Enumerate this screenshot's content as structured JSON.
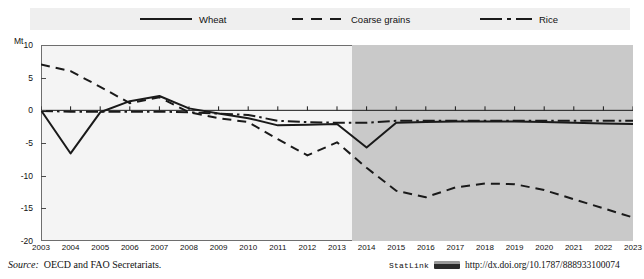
{
  "legend": {
    "entries": [
      {
        "label": "Wheat",
        "style": "solid",
        "key": "wheat-legend-key"
      },
      {
        "label": "Coarse grains",
        "style": "dashed",
        "key": "coarse-grains-legend-key"
      },
      {
        "label": "Rice",
        "style": "dash-dot",
        "key": "rice-legend-key"
      }
    ]
  },
  "axis": {
    "unit": "Mt",
    "y_ticks": [
      "10",
      "5",
      "0",
      "-5",
      "-10",
      "-15",
      "-20"
    ],
    "x_ticks": [
      "2003",
      "2004",
      "2005",
      "2006",
      "2007",
      "2008",
      "2009",
      "2010",
      "2011",
      "2012",
      "2013",
      "2014",
      "2015",
      "2016",
      "2017",
      "2018",
      "2019",
      "2020",
      "2021",
      "2022",
      "2023"
    ]
  },
  "footer": {
    "source_label": "Source:",
    "source_text": "OECD and FAO Secretariats.",
    "statlink_label": "StatLink",
    "statlink_url": "http://dx.doi.org/10.1787/888933100074"
  },
  "colors": {
    "line": "#1a1a1a",
    "plot_background": "#f4f4f4",
    "projection_shade": "#c9c9c9",
    "legend_band": "#efefef",
    "axis": "#6e6e6e"
  },
  "chart_data": {
    "type": "line",
    "title": "",
    "xlabel": "",
    "ylabel": "Mt",
    "ylim": [
      -20,
      10
    ],
    "xlim": [
      2003,
      2023
    ],
    "grid": false,
    "legend_position": "top",
    "projection_start": 2013.5,
    "annotations": [
      {
        "text": "Shaded area from 2014 onward denotes the projection period"
      }
    ],
    "x": [
      2003,
      2004,
      2005,
      2006,
      2007,
      2008,
      2009,
      2010,
      2011,
      2012,
      2013,
      2014,
      2015,
      2016,
      2017,
      2018,
      2019,
      2020,
      2021,
      2022,
      2023
    ],
    "series": [
      {
        "name": "Wheat",
        "style": "solid",
        "values": [
          0.0,
          -6.6,
          -0.3,
          1.4,
          2.2,
          0.3,
          -0.5,
          -1.2,
          -2.3,
          -2.2,
          -2.1,
          -5.7,
          -1.9,
          -1.8,
          -1.7,
          -1.7,
          -1.7,
          -1.8,
          -1.9,
          -2.0,
          -2.1
        ]
      },
      {
        "name": "Coarse grains",
        "style": "dashed",
        "values": [
          7.0,
          6.0,
          3.6,
          1.1,
          2.0,
          -0.3,
          -1.2,
          -1.8,
          -4.4,
          -6.9,
          -4.9,
          -8.8,
          -12.3,
          -13.3,
          -11.8,
          -11.2,
          -11.3,
          -12.2,
          -13.6,
          -15.0,
          -16.4
        ]
      },
      {
        "name": "Rice",
        "style": "dash-dot",
        "values": [
          -0.1,
          -0.2,
          -0.2,
          -0.2,
          -0.2,
          -0.3,
          -0.5,
          -0.7,
          -1.6,
          -1.8,
          -1.9,
          -1.9,
          -1.6,
          -1.6,
          -1.6,
          -1.6,
          -1.6,
          -1.6,
          -1.6,
          -1.6,
          -1.6
        ]
      }
    ]
  }
}
